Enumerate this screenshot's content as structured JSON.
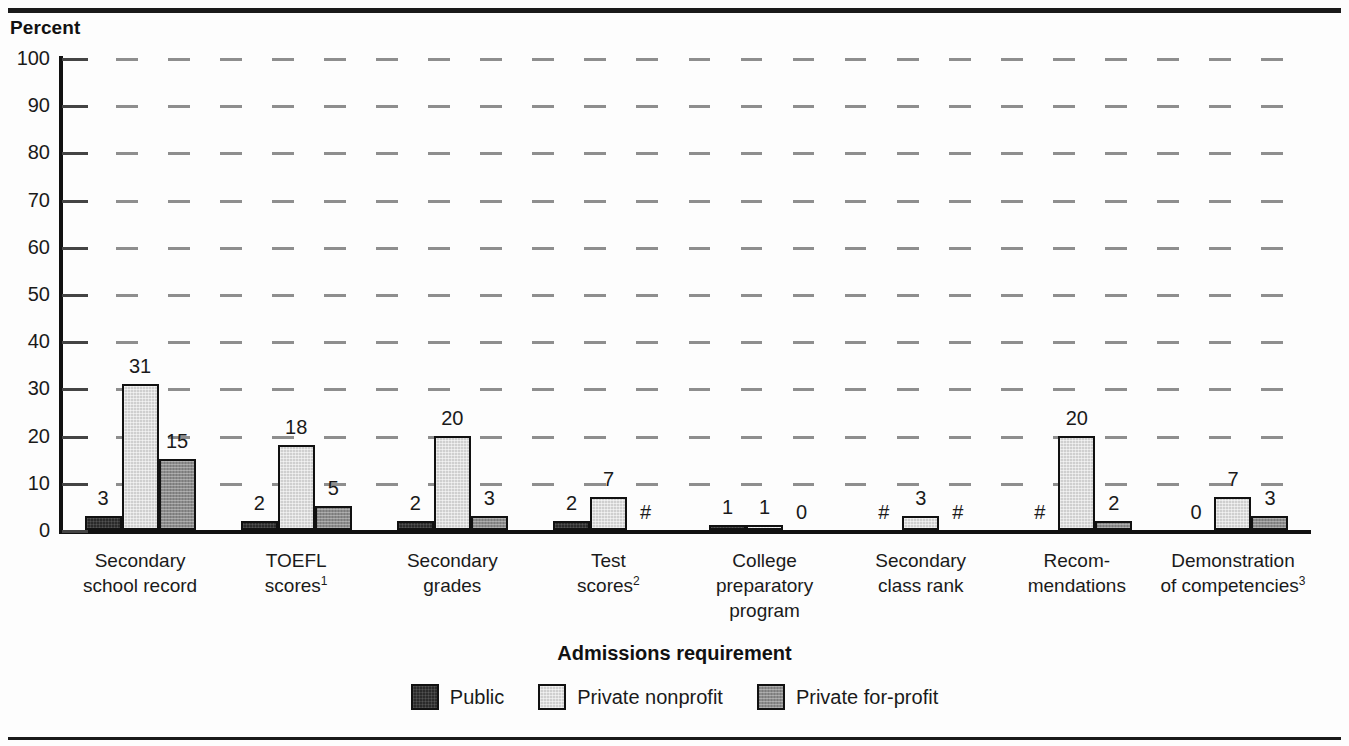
{
  "chart_data": {
    "type": "bar",
    "title": "",
    "xlabel": "Admissions requirement",
    "ylabel": "Percent",
    "ylim": [
      0,
      100
    ],
    "yticks": [
      0,
      10,
      20,
      30,
      40,
      50,
      60,
      70,
      80,
      90,
      100
    ],
    "grid": true,
    "legend_position": "bottom",
    "categories": [
      "Secondary school record",
      "TOEFL scores",
      "Secondary grades",
      "Test scores",
      "College preparatory program",
      "Secondary class rank",
      "Recom-mendations",
      "Demonstration of competencies"
    ],
    "category_lines": [
      [
        "Secondary",
        "school record"
      ],
      [
        "TOEFL",
        "scores"
      ],
      [
        "Secondary",
        "grades"
      ],
      [
        "Test",
        "scores"
      ],
      [
        "College",
        "preparatory",
        "program"
      ],
      [
        "Secondary",
        "class rank"
      ],
      [
        "Recom-",
        "mendations"
      ],
      [
        "Demonstration",
        "of competencies"
      ]
    ],
    "category_footnotes": [
      "",
      "1",
      "",
      "2",
      "",
      "",
      "",
      "3"
    ],
    "series": [
      {
        "name": "Public",
        "color": "#2a2a2a",
        "values": [
          3,
          2,
          2,
          2,
          1,
          0,
          0,
          0
        ],
        "labels": [
          "3",
          "2",
          "2",
          "2",
          "1",
          "#",
          "#",
          "0"
        ]
      },
      {
        "name": "Private nonprofit",
        "color": "#cfcfcf",
        "values": [
          31,
          18,
          20,
          7,
          1,
          3,
          20,
          7
        ],
        "labels": [
          "31",
          "18",
          "20",
          "7",
          "1",
          "3",
          "20",
          "7"
        ]
      },
      {
        "name": "Private for-profit",
        "color": "#8c8c8c",
        "values": [
          15,
          5,
          3,
          0,
          0,
          0,
          2,
          3
        ],
        "labels": [
          "15",
          "5",
          "3",
          "#",
          "0",
          "#",
          "2",
          "3"
        ]
      }
    ]
  },
  "legend": {
    "items": [
      {
        "label": "Public",
        "swatch": "public-swatch"
      },
      {
        "label": "Private nonprofit",
        "swatch": "private-nonprofit-swatch"
      },
      {
        "label": "Private for-profit",
        "swatch": "private-for-profit-swatch"
      }
    ]
  }
}
